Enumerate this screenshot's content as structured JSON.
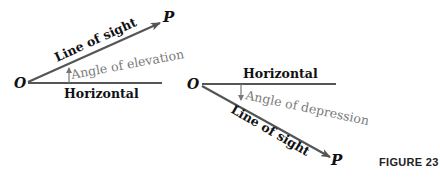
{
  "diagram_elevation": {
    "origin_label": "O",
    "point_label": "P",
    "line_of_sight_label": "Line of sight",
    "angle_label": "Angle of elevation",
    "horizontal_label": "Horizontal"
  },
  "diagram_depression": {
    "origin_label": "O",
    "point_label": "P",
    "line_of_sight_label": "Line of sight",
    "angle_label": "Angle of depression",
    "horizontal_label": "Horizontal"
  },
  "caption": "FIGURE 23",
  "colors": {
    "line": "#555555",
    "text": "#111111",
    "angle_text": "#7a7a7a"
  }
}
